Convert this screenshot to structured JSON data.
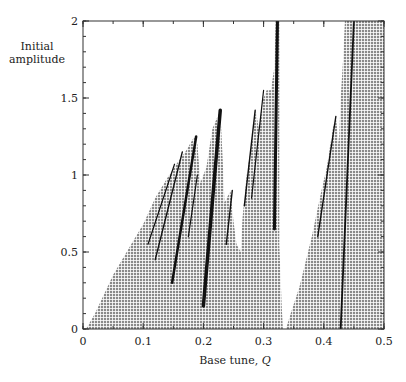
{
  "chart_data": {
    "type": "scatter",
    "subtype": "stability-region-map",
    "title": "",
    "xlabel": "Base tune, Q",
    "xlabel_text": "Base tune, ",
    "xlabel_symbol": "Q",
    "ylabel": "Initial amplitude",
    "ylabel_lines": [
      "Initial",
      "amplitude"
    ],
    "xlim": [
      0,
      0.5
    ],
    "ylim": [
      0,
      2
    ],
    "x_ticks": [
      0,
      0.1,
      0.2,
      0.3,
      0.4,
      0.5
    ],
    "x_tick_labels": [
      "0",
      "0.1",
      "0.2",
      "0.3",
      "0.4",
      "0.5"
    ],
    "y_ticks": [
      0,
      0.5,
      1,
      1.5,
      2
    ],
    "y_tick_labels": [
      "0",
      "0.5",
      "1",
      "1.5",
      "2"
    ],
    "x_minor_step": 0.05,
    "y_minor_step": 0.1,
    "grid": false,
    "legend": null,
    "fill_color": "#8a8a8a",
    "resonance_color": "#111111",
    "regions": [
      {
        "name": "stable-region-left",
        "boundary": [
          [
            0.005,
            0
          ],
          [
            0.02,
            0.1
          ],
          [
            0.05,
            0.35
          ],
          [
            0.08,
            0.55
          ],
          [
            0.1,
            0.68
          ],
          [
            0.12,
            0.85
          ],
          [
            0.14,
            0.98
          ],
          [
            0.155,
            1.07
          ],
          [
            0.17,
            1.15
          ],
          [
            0.185,
            1.25
          ],
          [
            0.19,
            1.2
          ],
          [
            0.195,
            0.95
          ],
          [
            0.205,
            1.05
          ],
          [
            0.215,
            1.3
          ],
          [
            0.228,
            1.42
          ],
          [
            0.232,
            1.1
          ],
          [
            0.235,
            0.82
          ],
          [
            0.245,
            0.9
          ],
          [
            0.25,
            0.7
          ],
          [
            0.255,
            0.55
          ],
          [
            0.262,
            0.5
          ],
          [
            0.265,
            0.72
          ],
          [
            0.272,
            1.0
          ],
          [
            0.28,
            1.2
          ],
          [
            0.287,
            1.42
          ],
          [
            0.292,
            1.3
          ],
          [
            0.298,
            1.48
          ],
          [
            0.305,
            1.55
          ],
          [
            0.312,
            1.55
          ],
          [
            0.318,
            1.7
          ],
          [
            0.32,
            2.0
          ],
          [
            0.326,
            2.0
          ],
          [
            0.326,
            0.55
          ],
          [
            0.33,
            0.15
          ],
          [
            0.332,
            0.0
          ]
        ]
      },
      {
        "name": "stable-region-right",
        "boundary": [
          [
            0.337,
            0
          ],
          [
            0.345,
            0.1
          ],
          [
            0.36,
            0.28
          ],
          [
            0.38,
            0.6
          ],
          [
            0.395,
            0.88
          ],
          [
            0.405,
            1.05
          ],
          [
            0.415,
            1.3
          ],
          [
            0.42,
            1.38
          ],
          [
            0.425,
            1.2
          ],
          [
            0.428,
            1.5
          ],
          [
            0.432,
            1.75
          ],
          [
            0.435,
            2.0
          ],
          [
            0.5,
            2.0
          ],
          [
            0.5,
            0
          ]
        ]
      }
    ],
    "resonance_lines": [
      {
        "from": [
          0.108,
          0.55
        ],
        "to": [
          0.152,
          1.07
        ],
        "width": 1.2
      },
      {
        "from": [
          0.12,
          0.45
        ],
        "to": [
          0.165,
          1.15
        ],
        "width": 1.4
      },
      {
        "from": [
          0.148,
          0.3
        ],
        "to": [
          0.188,
          1.25
        ],
        "width": 2.5
      },
      {
        "from": [
          0.175,
          0.6
        ],
        "to": [
          0.19,
          1.0
        ],
        "width": 1.2
      },
      {
        "from": [
          0.2,
          0.15
        ],
        "to": [
          0.228,
          1.42
        ],
        "width": 3.5
      },
      {
        "from": [
          0.238,
          0.55
        ],
        "to": [
          0.248,
          0.9
        ],
        "width": 1.4
      },
      {
        "from": [
          0.268,
          0.8
        ],
        "to": [
          0.286,
          1.42
        ],
        "width": 1.4
      },
      {
        "from": [
          0.28,
          0.85
        ],
        "to": [
          0.3,
          1.55
        ],
        "width": 1.2
      },
      {
        "from": [
          0.318,
          0.65
        ],
        "to": [
          0.323,
          2.0
        ],
        "width": 3.0
      },
      {
        "from": [
          0.39,
          0.6
        ],
        "to": [
          0.42,
          1.38
        ],
        "width": 1.4
      },
      {
        "from": [
          0.428,
          0.0
        ],
        "to": [
          0.45,
          2.0
        ],
        "width": 1.8
      }
    ]
  }
}
